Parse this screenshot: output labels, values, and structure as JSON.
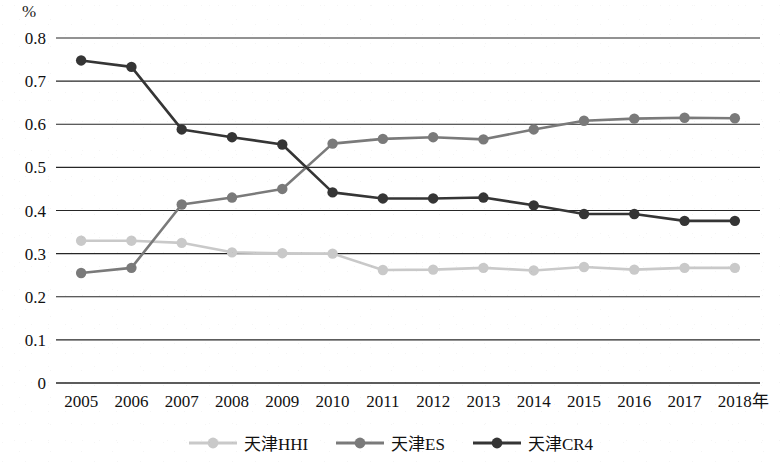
{
  "axis": {
    "unit_label": "%",
    "x_axis_name": "年",
    "y_ticks": [
      "0.8",
      "0.7",
      "0.6",
      "0.5",
      "0.4",
      "0.3",
      "0.2",
      "0.1",
      "0"
    ]
  },
  "legend": {
    "items": [
      {
        "label": "天津HHI",
        "color": "#c9c9c9"
      },
      {
        "label": "天津ES",
        "color": "#7a7a7a"
      },
      {
        "label": "天津CR4",
        "color": "#353535"
      }
    ]
  },
  "chart_data": {
    "type": "line",
    "title": "",
    "xlabel": "年",
    "ylabel": "%",
    "ylim": [
      0,
      0.8
    ],
    "yticks": [
      0,
      0.1,
      0.2,
      0.3,
      0.4,
      0.5,
      0.6,
      0.7,
      0.8
    ],
    "grid": true,
    "legend_position": "bottom",
    "categories": [
      "2005",
      "2006",
      "2007",
      "2008",
      "2009",
      "2010",
      "2011",
      "2012",
      "2013",
      "2014",
      "2015",
      "2016",
      "2017",
      "2018"
    ],
    "series": [
      {
        "name": "天津HHI",
        "color": "#c9c9c9",
        "values": [
          0.33,
          0.33,
          0.325,
          0.303,
          0.301,
          0.3,
          0.262,
          0.263,
          0.267,
          0.261,
          0.269,
          0.263,
          0.267,
          0.267
        ]
      },
      {
        "name": "天津ES",
        "color": "#7a7a7a",
        "values": [
          0.255,
          0.267,
          0.414,
          0.43,
          0.45,
          0.555,
          0.566,
          0.57,
          0.565,
          0.588,
          0.608,
          0.613,
          0.615,
          0.614
        ]
      },
      {
        "name": "天津CR4",
        "color": "#353535",
        "values": [
          0.748,
          0.733,
          0.588,
          0.57,
          0.553,
          0.442,
          0.428,
          0.428,
          0.43,
          0.412,
          0.392,
          0.392,
          0.376,
          0.376
        ]
      }
    ]
  }
}
